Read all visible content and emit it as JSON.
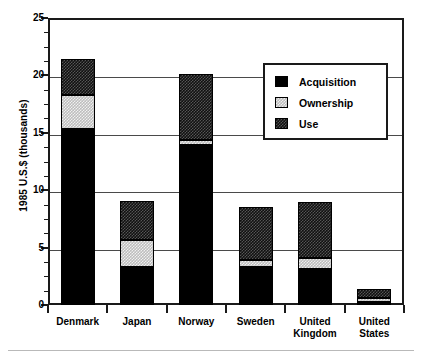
{
  "chart_data": {
    "type": "bar",
    "subtype": "stacked-vertical",
    "title": "",
    "xlabel": "",
    "ylabel": "1985 U.S.$ (thousands)",
    "ylim": [
      0,
      25
    ],
    "ytick_values": [
      0,
      5,
      10,
      15,
      20,
      25
    ],
    "ytick_labels": [
      "0",
      "5",
      "10",
      "15",
      "20",
      "25"
    ],
    "minor_ticks_per_interval": 4,
    "grid": "horizontal",
    "legend_position": "upper-right-inside",
    "categories": [
      "Denmark",
      "Japan",
      "Norway",
      "Sweden",
      "United Kingdom",
      "United States"
    ],
    "category_labels": [
      [
        "Denmark"
      ],
      [
        "Japan"
      ],
      [
        "Norway"
      ],
      [
        "Sweden"
      ],
      [
        "United",
        "Kingdom"
      ],
      [
        "United",
        "States"
      ]
    ],
    "series": [
      {
        "name": "Acquisition",
        "color": "#000000",
        "pattern": "solid-black",
        "values": [
          15.3,
          3.3,
          13.9,
          3.3,
          3.1,
          0.3
        ]
      },
      {
        "name": "Ownership",
        "color": "#bdbdbd",
        "pattern": "light-checker",
        "values": [
          3.0,
          2.4,
          0.5,
          0.6,
          1.0,
          0.3
        ]
      },
      {
        "name": "Use",
        "color": "#101010",
        "pattern": "dark-checker",
        "values": [
          3.1,
          3.4,
          5.7,
          4.6,
          4.9,
          0.8
        ]
      }
    ],
    "totals": [
      21.4,
      9.1,
      20.1,
      8.5,
      9.0,
      1.4
    ]
  },
  "legend": {
    "entries": [
      {
        "label": "Acquisition",
        "swatch": "acquisition-swatch"
      },
      {
        "label": "Ownership",
        "swatch": "ownership-swatch"
      },
      {
        "label": "Use",
        "swatch": "use-swatch"
      }
    ]
  }
}
